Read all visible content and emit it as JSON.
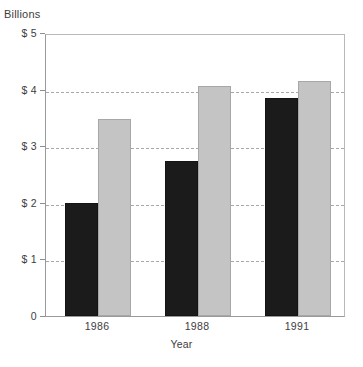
{
  "chart_data": {
    "type": "bar",
    "title": "",
    "subtitle": "",
    "unit_caption": "Billions",
    "xlabel": "Year",
    "ylabel": "",
    "categories": [
      "1986",
      "1988",
      "1991"
    ],
    "series": [
      {
        "name": "series-dark",
        "color": "#1b1b1b",
        "values": [
          2.0,
          2.73,
          3.85
        ]
      },
      {
        "name": "series-light",
        "color": "#c4c4c4",
        "values": [
          3.48,
          4.07,
          4.16
        ]
      }
    ],
    "ylim": [
      0,
      5
    ],
    "yticks": [
      0,
      1,
      2,
      3,
      4,
      5
    ],
    "ytick_labels": [
      "0",
      "$ 1",
      "$ 2",
      "$ 3",
      "$ 4",
      "$ 5"
    ],
    "grid": true,
    "grid_style": "dashed-horizontal",
    "legend": "none",
    "legend_position": "none"
  },
  "colors": {
    "dark_bar": "#1b1b1b",
    "light_bar": "#c4c4c4",
    "gridline": "#a8a8a8",
    "axis": "#9a9a9a",
    "text": "#3d3d3d",
    "background": "#ffffff"
  }
}
